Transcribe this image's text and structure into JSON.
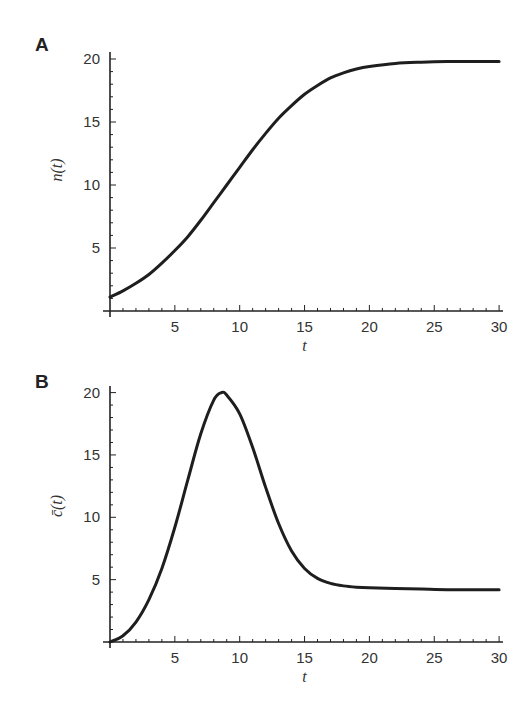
{
  "figure": {
    "panels": [
      {
        "label": "A",
        "ylabel": "n(t)",
        "xlabel": "t"
      },
      {
        "label": "B",
        "ylabel": "c̄(t)",
        "xlabel": "t"
      }
    ]
  },
  "chart_data": [
    {
      "type": "line",
      "panel": "A",
      "title": "",
      "xlabel": "t",
      "ylabel": "n(t)",
      "xlim": [
        0,
        30
      ],
      "ylim": [
        0,
        20.5
      ],
      "xticks": [
        5,
        10,
        15,
        20,
        25,
        30
      ],
      "yticks": [
        5,
        10,
        15,
        20
      ],
      "grid": false,
      "legend": null,
      "series": [
        {
          "name": "n(t)",
          "x": [
            0,
            1,
            2,
            3,
            4,
            5,
            6,
            7,
            8,
            9,
            10,
            11,
            12,
            13,
            14,
            15,
            16,
            17,
            18,
            19,
            20,
            22,
            24,
            26,
            28,
            30
          ],
          "values": [
            1.1,
            1.6,
            2.2,
            2.9,
            3.8,
            4.8,
            5.9,
            7.2,
            8.6,
            10.0,
            11.4,
            12.8,
            14.1,
            15.3,
            16.3,
            17.2,
            17.9,
            18.5,
            18.9,
            19.2,
            19.4,
            19.65,
            19.75,
            19.8,
            19.8,
            19.8
          ]
        }
      ]
    },
    {
      "type": "line",
      "panel": "B",
      "title": "",
      "xlabel": "t",
      "ylabel": "c̄(t)",
      "xlim": [
        0,
        30
      ],
      "ylim": [
        0,
        20.5
      ],
      "xticks": [
        5,
        10,
        15,
        20,
        25,
        30
      ],
      "yticks": [
        5,
        10,
        15,
        20
      ],
      "grid": false,
      "legend": null,
      "series": [
        {
          "name": "c̄(t)",
          "x": [
            0,
            1,
            2,
            3,
            4,
            5,
            6,
            7,
            8,
            8.6,
            9,
            10,
            11,
            12,
            13,
            14,
            15,
            16,
            17,
            18,
            19,
            20,
            22,
            24,
            26,
            28,
            30
          ],
          "values": [
            0,
            0.5,
            1.6,
            3.4,
            5.9,
            9.2,
            13.0,
            16.7,
            19.4,
            20.0,
            19.8,
            18.3,
            15.6,
            12.4,
            9.5,
            7.3,
            5.9,
            5.1,
            4.7,
            4.5,
            4.4,
            4.35,
            4.3,
            4.25,
            4.2,
            4.2,
            4.2
          ]
        }
      ]
    }
  ]
}
